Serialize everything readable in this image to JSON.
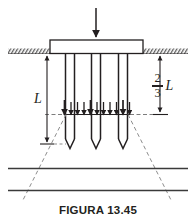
{
  "figure": {
    "caption": "FIGURA 13.45",
    "type": "engineering-diagram",
    "colors": {
      "line": "#231f20",
      "dashed": "#8d8d8d",
      "ground_hatch": "#5a5a5a",
      "background": "#ffffff"
    },
    "labels": {
      "embedment_depth": "L",
      "equivalent_depth_numerator": "2",
      "equivalent_depth_denominator": "3",
      "equivalent_depth_unit": "L"
    },
    "geometry": {
      "load_arrow_x": 96,
      "load_arrow_top": 8,
      "load_arrow_bottom": 36,
      "cap_left": 50,
      "cap_right": 143,
      "cap_top": 40,
      "cap_bottom": 53,
      "ground_y": 53,
      "ground_left_start": 8,
      "ground_left_end": 50,
      "ground_right_start": 143,
      "ground_right_end": 188,
      "pile_top": 53,
      "pile_tip_y": 148,
      "pile_body_bottom": 138,
      "pile_centers": [
        70,
        96,
        123
      ],
      "pile_width": 9,
      "pile_count": 3,
      "arrow_row_y": 114,
      "arrow_row_top": 100,
      "arrow_count": 11,
      "arrow_left": 64,
      "arrow_right": 130,
      "soil_layer_1_y": 168,
      "soil_layer_2_y": 190,
      "spread_left_bottom_x": 22,
      "spread_right_bottom_x": 172,
      "spread_bottom_y": 200,
      "dim_left_x": 47,
      "dim_left_top": 53,
      "dim_left_bottom": 144,
      "dim_right_x": 160,
      "dim_right_top": 53,
      "dim_right_bottom": 114
    }
  }
}
